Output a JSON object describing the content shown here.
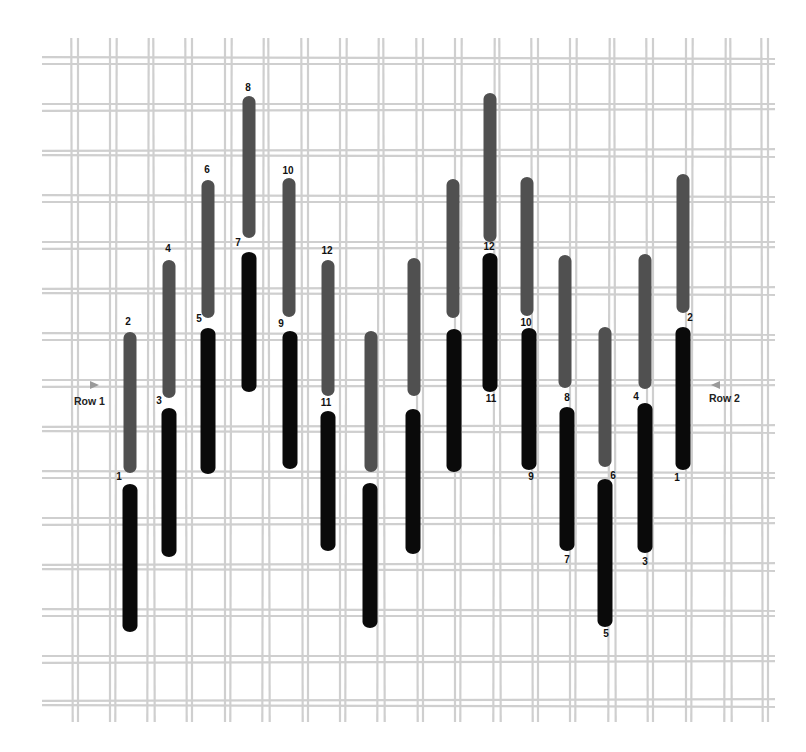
{
  "figure": {
    "colors": {
      "canvas_thread": "#cfcfcf",
      "upper_stitch": "#505050",
      "lower_stitch": "#0a0a0a",
      "label": "#111111",
      "arrow": "#9a9a9a",
      "background": "#ffffff"
    },
    "grid": {
      "vertical_pairs_x": [
        72,
        110,
        148,
        186,
        225,
        263,
        302,
        340,
        378,
        417,
        455,
        494,
        532,
        570,
        609,
        647,
        686,
        725,
        762
      ],
      "horizontal_pairs_y": [
        58,
        104,
        150,
        196,
        242,
        288,
        334,
        380,
        426,
        472,
        518,
        564,
        610,
        656,
        700
      ],
      "pair_gap": 6,
      "thread_width": 2.2,
      "x_extent": [
        42,
        775
      ],
      "y_extent": [
        38,
        722
      ]
    },
    "row_labels": [
      {
        "text": "Row 1",
        "x": 74,
        "y": 401,
        "arrow": "right",
        "arrow_x": 90,
        "arrow_y": 385
      },
      {
        "text": "Row 2",
        "x": 709,
        "y": 398,
        "arrow": "left",
        "arrow_x": 711,
        "arrow_y": 385
      }
    ],
    "stitches": [
      {
        "x": 130,
        "y1": 332,
        "y2": 473,
        "tone": "upper"
      },
      {
        "x": 130,
        "y1": 484,
        "y2": 632,
        "tone": "lower"
      },
      {
        "x": 169,
        "y1": 260,
        "y2": 398,
        "tone": "upper"
      },
      {
        "x": 169,
        "y1": 408,
        "y2": 557,
        "tone": "lower"
      },
      {
        "x": 208,
        "y1": 180,
        "y2": 318,
        "tone": "upper"
      },
      {
        "x": 208,
        "y1": 328,
        "y2": 474,
        "tone": "lower"
      },
      {
        "x": 249,
        "y1": 96,
        "y2": 238,
        "tone": "upper"
      },
      {
        "x": 249,
        "y1": 252,
        "y2": 392,
        "tone": "lower"
      },
      {
        "x": 289,
        "y1": 178,
        "y2": 317,
        "tone": "upper"
      },
      {
        "x": 290,
        "y1": 331,
        "y2": 469,
        "tone": "lower"
      },
      {
        "x": 328,
        "y1": 260,
        "y2": 396,
        "tone": "upper"
      },
      {
        "x": 328,
        "y1": 411,
        "y2": 551,
        "tone": "lower"
      },
      {
        "x": 371,
        "y1": 331,
        "y2": 472,
        "tone": "upper"
      },
      {
        "x": 370,
        "y1": 483,
        "y2": 628,
        "tone": "lower"
      },
      {
        "x": 414,
        "y1": 258,
        "y2": 396,
        "tone": "upper"
      },
      {
        "x": 413,
        "y1": 409,
        "y2": 554,
        "tone": "lower"
      },
      {
        "x": 453,
        "y1": 179,
        "y2": 318,
        "tone": "upper"
      },
      {
        "x": 454,
        "y1": 329,
        "y2": 472,
        "tone": "lower"
      },
      {
        "x": 490,
        "y1": 93,
        "y2": 242,
        "tone": "upper"
      },
      {
        "x": 490,
        "y1": 253,
        "y2": 392,
        "tone": "lower"
      },
      {
        "x": 527,
        "y1": 177,
        "y2": 316,
        "tone": "upper"
      },
      {
        "x": 529,
        "y1": 328,
        "y2": 470,
        "tone": "lower"
      },
      {
        "x": 565,
        "y1": 255,
        "y2": 388,
        "tone": "upper"
      },
      {
        "x": 567,
        "y1": 407,
        "y2": 551,
        "tone": "lower"
      },
      {
        "x": 605,
        "y1": 327,
        "y2": 467,
        "tone": "upper"
      },
      {
        "x": 605,
        "y1": 479,
        "y2": 627,
        "tone": "lower"
      },
      {
        "x": 645,
        "y1": 254,
        "y2": 389,
        "tone": "upper"
      },
      {
        "x": 645,
        "y1": 403,
        "y2": 553,
        "tone": "lower"
      },
      {
        "x": 683,
        "y1": 174,
        "y2": 313,
        "tone": "upper"
      },
      {
        "x": 683,
        "y1": 327,
        "y2": 470,
        "tone": "lower"
      }
    ],
    "labels": [
      {
        "text": "1",
        "x": 119,
        "y": 477
      },
      {
        "text": "2",
        "x": 128,
        "y": 322
      },
      {
        "text": "3",
        "x": 159,
        "y": 401
      },
      {
        "text": "4",
        "x": 168,
        "y": 249
      },
      {
        "text": "5",
        "x": 199,
        "y": 319
      },
      {
        "text": "6",
        "x": 207,
        "y": 170
      },
      {
        "text": "7",
        "x": 238,
        "y": 243
      },
      {
        "text": "8",
        "x": 248,
        "y": 88
      },
      {
        "text": "9",
        "x": 281,
        "y": 324
      },
      {
        "text": "10",
        "x": 288,
        "y": 171
      },
      {
        "text": "11",
        "x": 326,
        "y": 403
      },
      {
        "text": "12",
        "x": 327,
        "y": 251
      },
      {
        "text": "12",
        "x": 489,
        "y": 247
      },
      {
        "text": "11",
        "x": 491,
        "y": 399
      },
      {
        "text": "10",
        "x": 526,
        "y": 323
      },
      {
        "text": "9",
        "x": 531,
        "y": 477
      },
      {
        "text": "8",
        "x": 567,
        "y": 398
      },
      {
        "text": "7",
        "x": 567,
        "y": 560
      },
      {
        "text": "6",
        "x": 613,
        "y": 476
      },
      {
        "text": "5",
        "x": 606,
        "y": 634
      },
      {
        "text": "4",
        "x": 636,
        "y": 397
      },
      {
        "text": "3",
        "x": 645,
        "y": 562
      },
      {
        "text": "2",
        "x": 690,
        "y": 318
      },
      {
        "text": "1",
        "x": 677,
        "y": 478
      }
    ]
  }
}
